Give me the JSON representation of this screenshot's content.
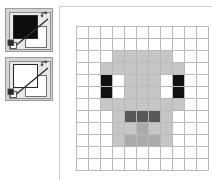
{
  "app": {
    "kind": "pixel-art-editor"
  },
  "tool_panel": {
    "widgets": [
      {
        "name": "foreground-color-widget",
        "main_swatch_label": "Foreground color",
        "main_swatch_color": "#0d0d0d",
        "secondary_swatch_label": "Background color",
        "secondary_swatch_color": "#ffffff",
        "swap_icon": "swap-arrows-icon",
        "default_icon": "default-colors-icon"
      },
      {
        "name": "background-color-widget",
        "main_swatch_label": "Foreground color",
        "main_swatch_color": "#ffffff",
        "secondary_swatch_label": "Background color",
        "secondary_swatch_color": "#ffffff",
        "swap_icon": "swap-arrows-icon",
        "default_icon": "default-colors-icon"
      }
    ]
  },
  "canvas": {
    "name": "pixel-grid-canvas",
    "columns": 11,
    "rows": 12,
    "cell_size_px": 11,
    "gridline_color": "#b9b9b9",
    "palette": {
      "white": "#ffffff",
      "light_gray": "#c6c6c6",
      "mid_gray": "#ababab",
      "dark_gray": "#585858",
      "black": "#111111"
    },
    "pixels": [
      [
        "white",
        "white",
        "white",
        "white",
        "white",
        "white",
        "white",
        "white",
        "white",
        "white",
        "white"
      ],
      [
        "white",
        "white",
        "white",
        "white",
        "white",
        "white",
        "white",
        "white",
        "white",
        "white",
        "white"
      ],
      [
        "white",
        "white",
        "white",
        "light_gray",
        "light_gray",
        "light_gray",
        "light_gray",
        "light_gray",
        "white",
        "white",
        "white"
      ],
      [
        "white",
        "white",
        "light_gray",
        "light_gray",
        "light_gray",
        "light_gray",
        "light_gray",
        "light_gray",
        "light_gray",
        "white",
        "white"
      ],
      [
        "white",
        "white",
        "black",
        "white",
        "light_gray",
        "light_gray",
        "light_gray",
        "white",
        "black",
        "white",
        "white"
      ],
      [
        "white",
        "white",
        "black",
        "white",
        "light_gray",
        "light_gray",
        "light_gray",
        "white",
        "black",
        "white",
        "white"
      ],
      [
        "white",
        "white",
        "light_gray",
        "light_gray",
        "light_gray",
        "light_gray",
        "light_gray",
        "light_gray",
        "light_gray",
        "white",
        "white"
      ],
      [
        "white",
        "white",
        "white",
        "light_gray",
        "dark_gray",
        "dark_gray",
        "dark_gray",
        "light_gray",
        "white",
        "white",
        "white"
      ],
      [
        "white",
        "white",
        "white",
        "light_gray",
        "light_gray",
        "mid_gray",
        "light_gray",
        "light_gray",
        "white",
        "white",
        "white"
      ],
      [
        "white",
        "white",
        "white",
        "light_gray",
        "mid_gray",
        "mid_gray",
        "mid_gray",
        "light_gray",
        "white",
        "white",
        "white"
      ],
      [
        "white",
        "white",
        "white",
        "white",
        "white",
        "white",
        "white",
        "white",
        "white",
        "white",
        "white"
      ],
      [
        "white",
        "white",
        "white",
        "white",
        "white",
        "white",
        "white",
        "white",
        "white",
        "white",
        "white"
      ]
    ]
  }
}
